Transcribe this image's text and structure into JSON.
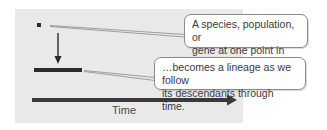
{
  "diagram": {
    "callouts": [
      {
        "line1": "A species, population, or",
        "line2": "gene at one point in time…"
      },
      {
        "line1": "…becomes a lineage as we follow",
        "line2": "its descendants through time."
      }
    ],
    "axis_label": "Time",
    "colors": {
      "panel": "#e9e9e9",
      "marks": "#2a2a2a",
      "callout_border": "#8a8a8a",
      "text": "#3a3a3a"
    },
    "elements": {
      "point": "square dot representing single point in time",
      "down_arrow": "arrow from point to lineage bar",
      "lineage_bar": "horizontal thick bar representing lineage",
      "time_arrow": "long right-pointing arrow representing time"
    }
  }
}
